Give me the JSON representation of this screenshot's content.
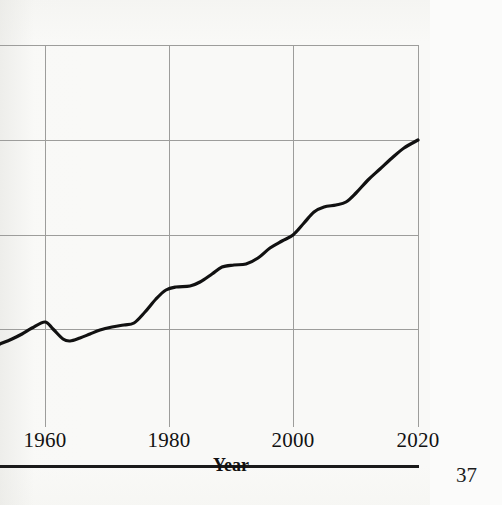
{
  "page": {
    "page_number": "37",
    "background_color": "#f8f8f6"
  },
  "axis": {
    "x_title": "Year",
    "tick_labels": [
      "1960",
      "1980",
      "2000",
      "2020"
    ]
  },
  "chart_data": {
    "type": "line",
    "title": "",
    "xlabel": "Year",
    "ylabel": "",
    "xlim": [
      1952.8,
      2020
    ],
    "ylim": [
      0,
      4
    ],
    "grid": true,
    "legend": null,
    "axis_note": "Y axis is cropped out of the image; y values are expressed in gridline units where the bottom visible gridline = 1 and the top = 4. Horizontal gridlines at 1, 2, 3, 4. Vertical gridlines at 1960, 1980, 2000, 2020.",
    "y_gridline_values": [
      1,
      2,
      3,
      4
    ],
    "x_gridline_values": [
      1960,
      1980,
      2000,
      2020
    ],
    "line_color": "#111111",
    "line_width": 3.2,
    "x": [
      1952.8,
      1956,
      1958,
      1960,
      1962,
      1965,
      1968,
      1971,
      1974,
      1977,
      1980,
      1983,
      1986,
      1989,
      1992,
      1995,
      1998,
      2000,
      2003,
      2006,
      2009,
      2012,
      2015,
      2018,
      2020
    ],
    "values": [
      0.81,
      0.9,
      0.99,
      1.07,
      0.99,
      0.92,
      0.95,
      1.0,
      1.02,
      1.12,
      1.4,
      1.43,
      1.49,
      1.63,
      1.69,
      1.86,
      2.07,
      2.2,
      2.43,
      2.48,
      2.6,
      2.83,
      3.07,
      3.25,
      3.34
    ],
    "series": [
      {
        "name": "series-1",
        "points_px": [
          [
            0,
            344
          ],
          [
            12,
            339
          ],
          [
            22,
            334
          ],
          [
            32,
            328
          ],
          [
            45,
            322
          ],
          [
            53,
            329
          ],
          [
            63,
            339
          ],
          [
            70,
            341
          ],
          [
            80,
            338
          ],
          [
            90,
            334
          ],
          [
            100,
            330
          ],
          [
            112,
            327
          ],
          [
            124,
            325
          ],
          [
            134,
            323
          ],
          [
            145,
            312
          ],
          [
            156,
            299
          ],
          [
            166,
            290
          ],
          [
            176,
            287
          ],
          [
            190,
            286
          ],
          [
            200,
            282
          ],
          [
            212,
            274
          ],
          [
            222,
            267
          ],
          [
            234,
            265
          ],
          [
            246,
            264
          ],
          [
            258,
            258
          ],
          [
            270,
            248
          ],
          [
            282,
            241
          ],
          [
            293,
            235
          ],
          [
            304,
            223
          ],
          [
            314,
            212
          ],
          [
            324,
            207
          ],
          [
            336,
            205
          ],
          [
            346,
            202
          ],
          [
            356,
            193
          ],
          [
            368,
            180
          ],
          [
            380,
            169
          ],
          [
            392,
            158
          ],
          [
            404,
            148
          ],
          [
            418,
            140
          ]
        ]
      }
    ]
  },
  "geometry": {
    "plot_left_px": 0,
    "plot_right_px": 418,
    "plot_top_px": 45,
    "plot_bottom_px": 420,
    "gridlines_h_px": [
      45,
      140,
      235,
      329
    ],
    "gridlines_v_px": [
      45,
      169,
      293,
      418
    ],
    "grid_color": "#9d9d9b",
    "axis_color": "#1a1a1a"
  }
}
